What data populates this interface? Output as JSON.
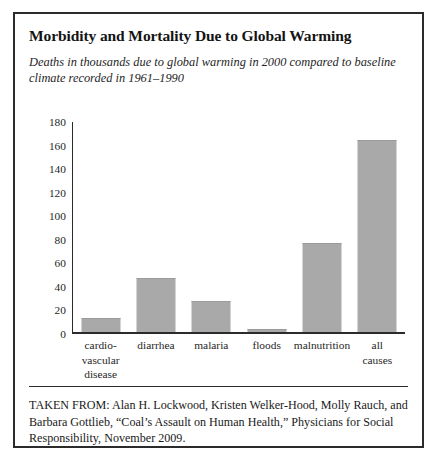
{
  "figure": {
    "title": "Morbidity and Mortality Due to Global Warming",
    "subtitle": "Deaths in thousands due to global warming in 2000 compared to baseline climate recorded in 1961–1990",
    "source_note": "TAKEN FROM: Alan H. Lockwood, Kristen Welker-Hood, Molly Rauch, and Barbara Gottlieb, “Coal’s Assault on Human Health,” Physicians for Social Responsibility, November 2009."
  },
  "style": {
    "bar_color": "#a9a9a9",
    "axis_color": "#2b2b2b",
    "border_color": "#2b2b2b",
    "text_color": "#1a1a1a",
    "background": "#ffffff"
  },
  "chart_data": {
    "type": "bar",
    "title": "Morbidity and Mortality Due to Global Warming",
    "subtitle": "Deaths in thousands due to global warming in 2000 compared to baseline climate recorded in 1961–1990",
    "xlabel": "",
    "ylabel": "",
    "ylim": [
      0,
      180
    ],
    "yticks": [
      0,
      20,
      40,
      60,
      80,
      100,
      120,
      140,
      160,
      180
    ],
    "ytick_labels": [
      "0",
      "20",
      "40",
      "60",
      "80",
      "100",
      "120",
      "140",
      "160",
      "180"
    ],
    "grid": false,
    "legend": false,
    "categories": [
      "cardio-vascular disease",
      "diarrhea",
      "malaria",
      "floods",
      "malnutrition",
      "all causes"
    ],
    "category_label_lines": [
      [
        "cardio-",
        "vascular",
        "disease"
      ],
      [
        "diarrhea"
      ],
      [
        "malaria"
      ],
      [
        "floods"
      ],
      [
        "malnutrition"
      ],
      [
        "all",
        "causes"
      ]
    ],
    "values": [
      12,
      47,
      27,
      3,
      77,
      165
    ],
    "bars": [
      {
        "category": "cardio-vascular disease",
        "value": 12
      },
      {
        "category": "diarrhea",
        "value": 47
      },
      {
        "category": "malaria",
        "value": 27
      },
      {
        "category": "floods",
        "value": 3
      },
      {
        "category": "malnutrition",
        "value": 77
      },
      {
        "category": "all causes",
        "value": 165
      }
    ]
  }
}
